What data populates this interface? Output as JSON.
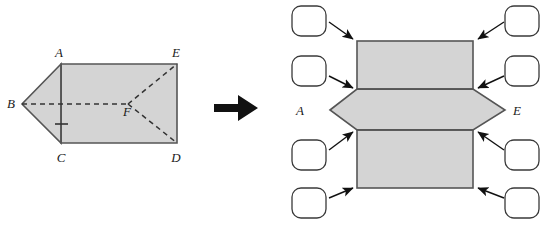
{
  "figure": {
    "colors": {
      "face_fill": "#d4d4d4",
      "edge_stroke": "#555555",
      "dashed_stroke": "#333333",
      "arrow_color": "#111111",
      "box_stroke": "#3a3a3a",
      "box_fill": "#ffffff",
      "label_color": "#1a1a1a",
      "background": "#ffffff"
    },
    "transform_arrow": {
      "name": "right-arrow",
      "symbol": "➡"
    }
  },
  "prism": {
    "caption": "triangular prism solid",
    "vertices": [
      {
        "id": "A",
        "label": "A",
        "x": 61,
        "y": 64,
        "label_x": 59,
        "label_y": 57
      },
      {
        "id": "B",
        "label": "B",
        "x": 22,
        "y": 104,
        "label_x": 13,
        "label_y": 106
      },
      {
        "id": "C",
        "label": "C",
        "x": 61,
        "y": 143,
        "label_x": 59,
        "label_y": 160
      },
      {
        "id": "D",
        "label": "D",
        "x": 177,
        "y": 143,
        "label_x": 174,
        "label_y": 160
      },
      {
        "id": "E",
        "label": "E",
        "x": 177,
        "y": 64,
        "label_x": 174,
        "label_y": 57
      },
      {
        "id": "F",
        "label": "F",
        "x": 128,
        "y": 104,
        "label_x": 126,
        "label_y": 114
      }
    ],
    "solid_edges": [
      "A-E",
      "E-D",
      "D-C",
      "C-A",
      "A-B",
      "B-C"
    ],
    "dashed_edges": [
      "B-F",
      "F-E",
      "F-D"
    ],
    "tick_mark": {
      "name": "congruence-tick",
      "x": 61,
      "y": 124
    }
  },
  "net": {
    "caption": "unfolded net of the prism",
    "rect_left": 357,
    "rect_right": 473,
    "band_tops": [
      41,
      89,
      130
    ],
    "band_bottoms": [
      89,
      130,
      188
    ],
    "apex_left_x": 330,
    "apex_right_x": 505,
    "apex_y": 110,
    "labels": [
      {
        "id": "A",
        "label": "A",
        "x": 300,
        "y": 115
      },
      {
        "id": "E",
        "label": "E",
        "x": 515,
        "y": 115
      }
    ]
  },
  "answer_boxes": [
    {
      "id": "box-top-left",
      "value": "",
      "x": 292,
      "y": 6,
      "w": 34,
      "h": 30,
      "arrow": {
        "x1": 328,
        "y1": 22,
        "x2": 354,
        "y2": 39
      }
    },
    {
      "id": "box-mid-left",
      "value": "",
      "x": 292,
      "y": 56,
      "w": 34,
      "h": 30,
      "arrow": {
        "x1": 328,
        "y1": 76,
        "x2": 354,
        "y2": 88
      }
    },
    {
      "id": "box-bottom-left",
      "value": "",
      "x": 292,
      "y": 140,
      "w": 34,
      "h": 30,
      "arrow": {
        "x1": 328,
        "y1": 150,
        "x2": 354,
        "y2": 132
      }
    },
    {
      "id": "box-low-left",
      "value": "",
      "x": 292,
      "y": 188,
      "w": 34,
      "h": 30,
      "arrow": {
        "x1": 328,
        "y1": 198,
        "x2": 354,
        "y2": 187
      }
    },
    {
      "id": "box-top-right",
      "value": "",
      "x": 505,
      "y": 6,
      "w": 34,
      "h": 30,
      "arrow": {
        "x1": 503,
        "y1": 22,
        "x2": 477,
        "y2": 39
      }
    },
    {
      "id": "box-mid-right",
      "value": "",
      "x": 505,
      "y": 56,
      "w": 34,
      "h": 30,
      "arrow": {
        "x1": 503,
        "y1": 76,
        "x2": 477,
        "y2": 88
      }
    },
    {
      "id": "box-bottom-right",
      "value": "",
      "x": 505,
      "y": 140,
      "w": 34,
      "h": 30,
      "arrow": {
        "x1": 503,
        "y1": 150,
        "x2": 477,
        "y2": 132
      }
    },
    {
      "id": "box-low-right",
      "value": "",
      "x": 505,
      "y": 188,
      "w": 34,
      "h": 30,
      "arrow": {
        "x1": 503,
        "y1": 198,
        "x2": 477,
        "y2": 187
      }
    }
  ]
}
